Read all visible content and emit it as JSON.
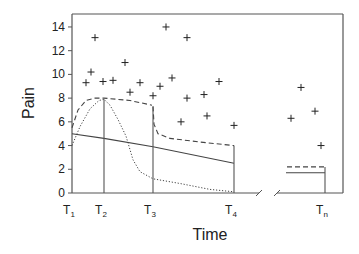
{
  "chart_data": {
    "type": "line",
    "title": "",
    "xlabel": "Time",
    "ylabel": "Pain",
    "ylim": [
      0,
      15
    ],
    "yticks": [
      0,
      2,
      4,
      6,
      8,
      10,
      12,
      14
    ],
    "grid": false,
    "legend": null,
    "axis_break": "between T4 and Tn",
    "time_points": [
      {
        "label": "T",
        "sub": "1"
      },
      {
        "label": "T",
        "sub": "2"
      },
      {
        "label": "T",
        "sub": "3"
      },
      {
        "label": "T",
        "sub": "4"
      },
      {
        "label": "T",
        "sub": "n"
      }
    ],
    "scatter_points": [
      {
        "x": 86,
        "y": 9.3
      },
      {
        "x": 91,
        "y": 10.2
      },
      {
        "x": 95,
        "y": 13.1
      },
      {
        "x": 103,
        "y": 9.4
      },
      {
        "x": 113,
        "y": 9.5
      },
      {
        "x": 125,
        "y": 11.0
      },
      {
        "x": 130,
        "y": 8.5
      },
      {
        "x": 140,
        "y": 9.3
      },
      {
        "x": 153,
        "y": 8.2
      },
      {
        "x": 160,
        "y": 9.0
      },
      {
        "x": 166,
        "y": 14.0
      },
      {
        "x": 172,
        "y": 9.7
      },
      {
        "x": 181,
        "y": 6.0
      },
      {
        "x": 187,
        "y": 13.1
      },
      {
        "x": 187,
        "y": 8.0
      },
      {
        "x": 204,
        "y": 8.3
      },
      {
        "x": 207,
        "y": 6.5
      },
      {
        "x": 219,
        "y": 9.4
      },
      {
        "x": 234,
        "y": 5.7
      },
      {
        "x": 291,
        "y": 6.3
      },
      {
        "x": 301,
        "y": 8.9
      },
      {
        "x": 315,
        "y": 6.9
      },
      {
        "x": 321,
        "y": 4.0
      }
    ],
    "series": [
      {
        "name": "dashed-curve",
        "style": "dashed",
        "segments": [
          [
            [
              72,
              5.5
            ],
            [
              78,
              7.0
            ],
            [
              86,
              7.8
            ],
            [
              95,
              8.0
            ],
            [
              104,
              8.0
            ],
            [
              130,
              7.8
            ],
            [
              152,
              7.4
            ]
          ],
          [
            [
              153,
              7.3
            ],
            [
              154,
              5.8
            ],
            [
              158,
              5.0
            ],
            [
              170,
              4.6
            ],
            [
              200,
              4.3
            ],
            [
              234,
              4.0
            ]
          ],
          [
            [
              287,
              2.2
            ],
            [
              325,
              2.2
            ]
          ]
        ]
      },
      {
        "name": "solid-line",
        "style": "solid",
        "segments": [
          [
            [
              72,
              5.0
            ],
            [
              104,
              4.6
            ],
            [
              153,
              3.9
            ],
            [
              234,
              2.5
            ]
          ],
          [
            [
              286,
              1.7
            ],
            [
              325,
              1.7
            ]
          ]
        ]
      },
      {
        "name": "dotted-curve",
        "style": "dotted",
        "segments": [
          [
            [
              72,
              4.0
            ],
            [
              80,
              5.6
            ],
            [
              90,
              7.1
            ],
            [
              99,
              7.8
            ],
            [
              104,
              7.9
            ],
            [
              110,
              7.4
            ],
            [
              118,
              6.2
            ],
            [
              126,
              4.8
            ],
            [
              133,
              2.8
            ],
            [
              140,
              1.8
            ],
            [
              153,
              1.2
            ],
            [
              180,
              0.8
            ],
            [
              210,
              0.3
            ],
            [
              234,
              0.1
            ]
          ]
        ]
      }
    ],
    "vertical_markers": [
      {
        "x": 104,
        "top": 7.9,
        "label_index": 1
      },
      {
        "x": 153,
        "top": 7.3,
        "label_index": 2
      },
      {
        "x": 234,
        "top": 4.0,
        "label_index": 3
      },
      {
        "x": 325,
        "top": 2.2,
        "label_index": 4
      }
    ]
  }
}
